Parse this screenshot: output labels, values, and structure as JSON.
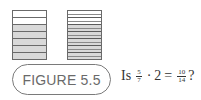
{
  "figure": {
    "label": "FIGURE 5.5",
    "left_bar": {
      "total_parts": 7,
      "shaded_parts": 5,
      "fraction": "5/7"
    },
    "right_bar": {
      "total_parts": 14,
      "shaded_parts": 10,
      "fraction": "10/14"
    },
    "question": {
      "prefix": "Is",
      "frac1_num": "5",
      "frac1_den": "7",
      "dot": "·",
      "multiplier": "2",
      "equals": "=",
      "frac2_num": "10",
      "frac2_den": "14",
      "suffix": "?"
    },
    "colors": {
      "shaded": "#d9d9d9",
      "border": "#6a6a6a",
      "label_text": "#6a6a6a"
    }
  }
}
